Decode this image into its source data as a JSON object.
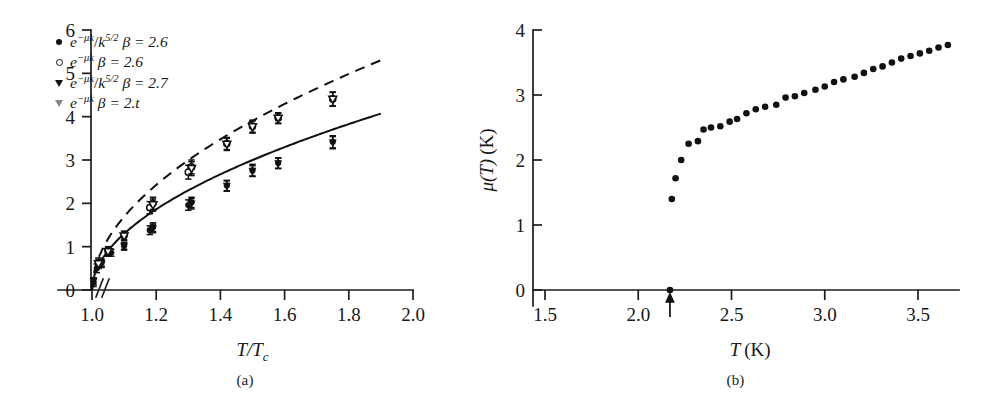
{
  "figure": {
    "panels": [
      {
        "id": "a",
        "caption": "(a)"
      },
      {
        "id": "b",
        "caption": "(b)"
      }
    ]
  },
  "panel_a": {
    "caption": "(a)",
    "legend": [
      {
        "marker": "filled-circle",
        "model": "e^{-μk}/k^{5/2}",
        "param": "β = 2.6",
        "text": "e−μk/k5/2 β = 2.6"
      },
      {
        "marker": "open-circle",
        "model": "e^{-μk}",
        "param": "β = 2.6",
        "text": "e−μk β = 2.6"
      },
      {
        "marker": "filled-triangle-down",
        "model": "e^{-μk}/k^{5/2}",
        "param": "β = 2.7",
        "text": "e−μk/k5/2 β = 2.7"
      },
      {
        "marker": "open-triangle-down",
        "model": "e^{-μk}",
        "param": "β = 2.t",
        "text": "e−μk β = 2.t"
      }
    ],
    "axes": {
      "x_label": "T/T",
      "x_label_sub": "c",
      "y_label": "",
      "x_ticks": [
        "1.0",
        "1.2",
        "1.4",
        "1.6",
        "1.8",
        "2.0"
      ],
      "y_ticks": [
        "0",
        "1",
        "2",
        "3",
        "4",
        "5",
        "6"
      ],
      "x_break": true
    }
  },
  "panel_b": {
    "caption": "(b)",
    "axes": {
      "x_label": "T",
      "x_unit": "(K)",
      "y_label": "μ(T)",
      "y_unit": "(K)",
      "x_ticks": [
        "1.5",
        "2.0",
        "2.5",
        "3.0",
        "3.5"
      ],
      "y_ticks": [
        "0",
        "1",
        "2",
        "3",
        "4"
      ]
    },
    "annotation": {
      "type": "arrow-up",
      "x_value": 2.17
    }
  },
  "colors": {
    "ink": "#111111",
    "background": "#ffffff",
    "marker_fill": "#111111",
    "marker_open": "#ffffff"
  },
  "chart_data": [
    {
      "type": "scatter",
      "panel": "(a)",
      "title": "",
      "xlabel": "T/Tc",
      "ylabel": "",
      "xlim": [
        0.95,
        2.0
      ],
      "ylim": [
        0,
        6
      ],
      "grid": false,
      "legend_position": "top-left",
      "x_tick_values": [
        1.0,
        1.2,
        1.4,
        1.6,
        1.8,
        2.0
      ],
      "y_tick_values": [
        0,
        1,
        2,
        3,
        4,
        5,
        6
      ],
      "series": [
        {
          "name": "e^{-μk}/k^{5/2}  β = 2.6",
          "marker": "filled-circle",
          "line": "solid",
          "x": [
            1.005,
            1.015,
            1.03,
            1.06,
            1.1,
            1.18,
            1.19,
            1.3,
            1.31,
            1.42,
            1.5,
            1.58,
            1.75
          ],
          "y": [
            0.18,
            0.5,
            0.63,
            0.86,
            1.02,
            1.38,
            1.45,
            1.96,
            2.02,
            2.41,
            2.76,
            2.93,
            3.42
          ],
          "yerr": [
            0.1,
            0.1,
            0.08,
            0.08,
            0.08,
            0.1,
            0.1,
            0.12,
            0.12,
            0.12,
            0.14,
            0.12,
            0.14
          ]
        },
        {
          "name": "e^{-μk}  β = 2.6",
          "marker": "open-circle",
          "line": "dashed",
          "x": [
            1.02,
            1.05,
            1.1,
            1.18,
            1.19,
            1.3,
            1.31,
            1.42,
            1.5,
            1.58,
            1.75
          ],
          "y": [
            0.62,
            0.9,
            1.26,
            1.9,
            2.0,
            2.72,
            2.84,
            3.38,
            3.78,
            3.97,
            4.41
          ],
          "yerr": [
            0.12,
            0.1,
            0.1,
            0.14,
            0.14,
            0.16,
            0.16,
            0.14,
            0.14,
            0.12,
            0.16
          ]
        },
        {
          "name": "e^{-μk}/k^{5/2}  β = 2.7",
          "marker": "filled-triangle-down",
          "line": "none",
          "x": [
            1.005,
            1.03,
            1.1,
            1.19,
            1.31,
            1.42,
            1.5,
            1.58,
            1.75
          ],
          "y": [
            0.2,
            0.6,
            1.0,
            1.42,
            1.99,
            2.4,
            2.75,
            2.92,
            3.4
          ],
          "yerr": [
            0.08,
            0.08,
            0.08,
            0.1,
            0.12,
            0.12,
            0.12,
            0.12,
            0.14
          ]
        },
        {
          "name": "e^{-μk}  β = 2.t",
          "marker": "open-triangle-down",
          "line": "none",
          "x": [
            1.02,
            1.05,
            1.1,
            1.19,
            1.31,
            1.42,
            1.5,
            1.58,
            1.75
          ],
          "y": [
            0.6,
            0.88,
            1.24,
            1.96,
            2.8,
            3.36,
            3.76,
            3.96,
            4.4
          ],
          "yerr": [
            0.1,
            0.1,
            0.1,
            0.14,
            0.16,
            0.14,
            0.14,
            0.12,
            0.16
          ]
        }
      ],
      "fit_curves": [
        {
          "name": "solid fit",
          "style": "solid",
          "note": "power-law fit through filled points"
        },
        {
          "name": "dashed fit",
          "style": "dashed",
          "note": "power-law fit through open points"
        }
      ]
    },
    {
      "type": "scatter",
      "panel": "(b)",
      "title": "",
      "xlabel": "T (K)",
      "ylabel": "μ(T) (K)",
      "xlim": [
        1.45,
        3.72
      ],
      "ylim": [
        0,
        4
      ],
      "grid": false,
      "x_tick_values": [
        1.5,
        2.0,
        2.5,
        3.0,
        3.5
      ],
      "y_tick_values": [
        0,
        1,
        2,
        3,
        4
      ],
      "annotation_arrow_x": 2.17,
      "series": [
        {
          "name": "μ(T)",
          "marker": "filled-circle",
          "x": [
            2.17,
            2.18,
            2.2,
            2.23,
            2.27,
            2.32,
            2.35,
            2.39,
            2.44,
            2.49,
            2.53,
            2.58,
            2.63,
            2.68,
            2.74,
            2.79,
            2.84,
            2.89,
            2.95,
            3.0,
            3.05,
            3.1,
            3.16,
            3.21,
            3.26,
            3.31,
            3.36,
            3.41,
            3.46,
            3.51,
            3.56,
            3.61,
            3.66
          ],
          "y": [
            0.0,
            1.4,
            1.72,
            2.0,
            2.25,
            2.29,
            2.47,
            2.5,
            2.52,
            2.59,
            2.63,
            2.72,
            2.78,
            2.82,
            2.85,
            2.96,
            2.98,
            3.03,
            3.08,
            3.13,
            3.2,
            3.24,
            3.28,
            3.34,
            3.4,
            3.44,
            3.5,
            3.56,
            3.6,
            3.64,
            3.68,
            3.73,
            3.77
          ]
        }
      ]
    }
  ]
}
